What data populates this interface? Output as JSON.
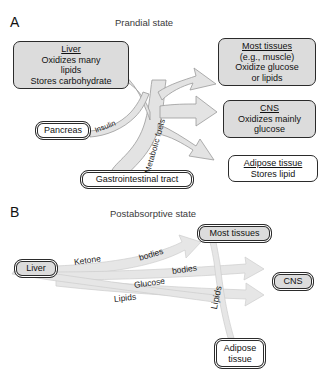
{
  "figure": {
    "panels": [
      {
        "letter": "A",
        "title": "Prandial state",
        "nodes": [
          {
            "id": "liver",
            "title": "Liver",
            "lines": [
              "Oxidizes many",
              "lipids",
              "Stores carbohydrate"
            ],
            "fill": "#dcdcdc"
          },
          {
            "id": "pancreas",
            "title": "Pancreas",
            "lines": [],
            "fill": "#ffffff"
          },
          {
            "id": "gi-tract",
            "title": "Gastrointestinal tract",
            "lines": [],
            "fill": "#ffffff"
          },
          {
            "id": "most-tissues",
            "title": "Most tissues",
            "lines": [
              "(e.g., muscle)",
              "Oxidize glucose",
              "or lipids"
            ],
            "fill": "#dcdcdc"
          },
          {
            "id": "cns",
            "title": "CNS",
            "lines": [
              "Oxidizes mainly",
              "glucose"
            ],
            "fill": "#dcdcdc"
          },
          {
            "id": "adipose",
            "title": "Adipose tissue",
            "lines": [
              "Stores lipid"
            ],
            "fill": "#ffffff"
          }
        ],
        "edge_labels": [
          {
            "id": "insulin",
            "text": "Insulin"
          },
          {
            "id": "metabolic-fuels",
            "text": "Metabolic fuels"
          }
        ]
      },
      {
        "letter": "B",
        "title": "Postabsorptive state",
        "nodes": [
          {
            "id": "liver",
            "title": "Liver",
            "lines": [],
            "fill": "#dcdcdc"
          },
          {
            "id": "most-tissues",
            "title": "Most tissues",
            "lines": [],
            "fill": "#dcdcdc"
          },
          {
            "id": "cns",
            "title": "CNS",
            "lines": [],
            "fill": "#dcdcdc"
          },
          {
            "id": "adipose",
            "title": "Adipose",
            "lines": [
              "tissue"
            ],
            "fill": "#ffffff"
          }
        ],
        "edge_labels": [
          {
            "id": "ketone",
            "text": "Ketone"
          },
          {
            "id": "bodies-1",
            "text": "bodies"
          },
          {
            "id": "bodies-2",
            "text": "bodies"
          },
          {
            "id": "glucose",
            "text": "Glucose"
          },
          {
            "id": "lipids",
            "text": "Lipids"
          },
          {
            "id": "lipids-vertical",
            "text": "Lipids"
          }
        ]
      }
    ]
  },
  "colors": {
    "node_fill_gray": "#dcdcdc",
    "node_fill_white": "#ffffff",
    "node_stroke": "#2b2b2b",
    "arrow_fill": "#e3e3e3",
    "arrow_stroke": "#9a9a9a",
    "text": "#111111"
  }
}
